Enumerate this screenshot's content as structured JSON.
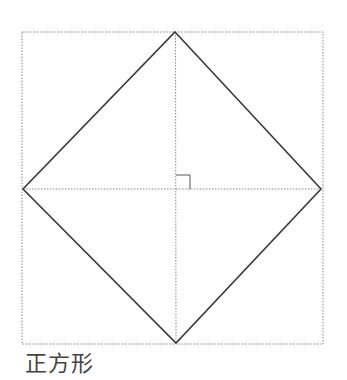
{
  "caption": "正方形",
  "colors": {
    "shape_stroke": "#3a3a3a",
    "guide_stroke": "#888888",
    "marker_stroke": "#555555",
    "background": "#ffffff"
  },
  "diagram": {
    "type": "square-rotated-45",
    "frame": {
      "x1": 22,
      "y1": 32,
      "x2": 323,
      "y2": 344,
      "style": "dotted"
    },
    "vertices": {
      "top": [
        175,
        32
      ],
      "right": [
        321,
        189
      ],
      "bottom": [
        176,
        343
      ],
      "left": [
        23,
        189
      ]
    },
    "diagonals": [
      {
        "from": [
          175,
          32
        ],
        "to": [
          176,
          343
        ],
        "style": "dotted"
      },
      {
        "from": [
          23,
          189
        ],
        "to": [
          321,
          189
        ],
        "style": "dotted"
      }
    ],
    "right_angle_marker": {
      "x": 176,
      "y": 175,
      "size": 14
    }
  }
}
